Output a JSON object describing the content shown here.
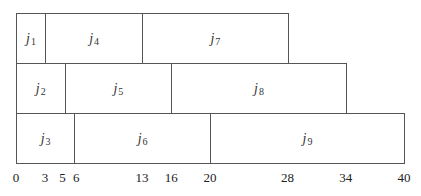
{
  "diagram": {
    "type": "gantt-schedule",
    "axis": {
      "min": 0,
      "max": 40,
      "ticks": [
        0,
        3,
        5,
        6,
        13,
        16,
        20,
        28,
        34,
        40
      ]
    },
    "rows": [
      {
        "machine": 1,
        "jobs": [
          {
            "label": "j",
            "index": "1",
            "start": 0,
            "end": 3
          },
          {
            "label": "j",
            "index": "4",
            "start": 3,
            "end": 13
          },
          {
            "label": "j",
            "index": "7",
            "start": 13,
            "end": 28
          }
        ]
      },
      {
        "machine": 2,
        "jobs": [
          {
            "label": "j",
            "index": "2",
            "start": 0,
            "end": 5
          },
          {
            "label": "j",
            "index": "5",
            "start": 5,
            "end": 16
          },
          {
            "label": "j",
            "index": "8",
            "start": 16,
            "end": 34
          }
        ]
      },
      {
        "machine": 3,
        "jobs": [
          {
            "label": "j",
            "index": "3",
            "start": 0,
            "end": 6
          },
          {
            "label": "j",
            "index": "6",
            "start": 6,
            "end": 20
          },
          {
            "label": "j",
            "index": "9",
            "start": 20,
            "end": 40
          }
        ]
      }
    ],
    "colors": {
      "border": "#555555",
      "fill": "#ffffff",
      "text": "#333333"
    }
  }
}
